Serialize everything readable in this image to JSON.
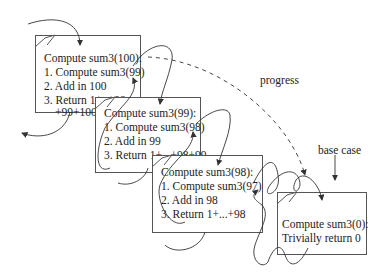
{
  "frames": [
    {
      "title": "Compute sum3(100):",
      "steps": [
        "1. Compute sum3(99)",
        "2. Add in 100",
        "3. Return 1+..+98",
        "+99+100"
      ]
    },
    {
      "title": "Compute sum3(99):",
      "steps": [
        "1. Compute sum3(98)",
        "2. Add in 99",
        "3. Return 1+...+98+99"
      ]
    },
    {
      "title": "Compute sum3(98):",
      "steps": [
        "1. Compute sum3(97)",
        "2. Add in 98",
        "3. Return 1+...+98"
      ]
    },
    {
      "title": "Compute sum3(0):",
      "steps": [
        "Trivially return 0"
      ]
    }
  ],
  "labels": {
    "progress": "progress",
    "base_case": "base case"
  }
}
